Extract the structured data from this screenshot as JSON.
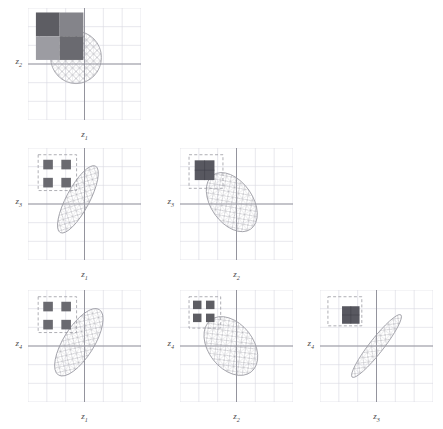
{
  "figure": {
    "type": "pairwise-covariance-ellipse-matrix",
    "width": 443,
    "height": 429,
    "background": "#ffffff",
    "variables": [
      "z1",
      "z2",
      "z3",
      "z4"
    ],
    "grid_color": "#d8d8e0",
    "axis_color": "#8a8a94",
    "ellipse_stroke": "#9a9aa2",
    "mesh_color": "#a8a8b0",
    "inset_dash_color": "#9a9aa2"
  },
  "chart_data": {
    "type": "scatter",
    "title": "",
    "xlabel": "",
    "ylabel": "",
    "grid": true,
    "legend": null,
    "panels": [
      {
        "id": "panel-z2-z1",
        "row": 0,
        "col": 0,
        "xlabel": "z",
        "xlabel_sub": "1",
        "ylabel": "z",
        "ylabel_sub": "2",
        "xlim": [
          -3,
          3
        ],
        "ylim": [
          -3,
          3
        ],
        "grid_divisions": 6,
        "ellipse": {
          "cx": -0.45,
          "cy": 0.35,
          "rx": 1.35,
          "ry": 1.4,
          "angle_deg": 0,
          "correlation": 0.0,
          "shape": "circle"
        },
        "inset": {
          "kind": "matrix-2x2-contiguous",
          "dash_box": {
            "x": 0.1,
            "y": 0.06,
            "w": 0.33,
            "h": 0.33
          },
          "blocks": [
            {
              "r": 0,
              "c": 0,
              "shade": "#5d5d63"
            },
            {
              "r": 0,
              "c": 1,
              "shade": "#84848a"
            },
            {
              "r": 1,
              "c": 0,
              "shade": "#9c9ca2"
            },
            {
              "r": 1,
              "c": 1,
              "shade": "#6a6a70"
            }
          ],
          "block_origin": {
            "x": 0.07,
            "y": 0.04
          },
          "block_size": 0.21
        }
      },
      {
        "id": "panel-z3-z1",
        "row": 1,
        "col": 0,
        "xlabel": "z",
        "xlabel_sub": "1",
        "ylabel": "z",
        "ylabel_sub": "3",
        "xlim": [
          -3,
          3
        ],
        "ylim": [
          -3,
          3
        ],
        "grid_divisions": 6,
        "ellipse": {
          "cx": -0.35,
          "cy": 0.25,
          "rx": 2.0,
          "ry": 0.62,
          "angle_deg": -62,
          "correlation": 0.88,
          "shape": "narrow-ellipse"
        },
        "inset": {
          "kind": "matrix-2x2-separated",
          "dash_box": {
            "x": 0.09,
            "y": 0.06,
            "w": 0.34,
            "h": 0.32
          },
          "blocks": [
            {
              "r": 0,
              "c": 0,
              "shade": "#6a6a70"
            },
            {
              "r": 0,
              "c": 1,
              "shade": "#6a6a70"
            },
            {
              "r": 1,
              "c": 0,
              "shade": "#6a6a70"
            },
            {
              "r": 1,
              "c": 1,
              "shade": "#6a6a70"
            }
          ],
          "block_size": 0.085,
          "block_gap": 0.075
        }
      },
      {
        "id": "panel-z3-z2",
        "row": 1,
        "col": 1,
        "xlabel": "z",
        "xlabel_sub": "2",
        "ylabel": "z",
        "ylabel_sub": "3",
        "xlim": [
          -3,
          3
        ],
        "ylim": [
          -3,
          3
        ],
        "grid_divisions": 6,
        "ellipse": {
          "cx": -0.25,
          "cy": 0.1,
          "rx": 1.75,
          "ry": 1.12,
          "angle_deg": 55,
          "correlation": -0.45,
          "shape": "wide-ellipse"
        },
        "inset": {
          "kind": "matrix-single-block",
          "dash_box": {
            "x": 0.08,
            "y": 0.06,
            "w": 0.3,
            "h": 0.3
          },
          "blocks": [
            {
              "r": 0,
              "c": 0,
              "shade": "#585860"
            }
          ],
          "block_origin": {
            "x": 0.13,
            "y": 0.11
          },
          "block_size": 0.175
        }
      },
      {
        "id": "panel-z4-z1",
        "row": 2,
        "col": 0,
        "xlabel": "z",
        "xlabel_sub": "1",
        "ylabel": "z",
        "ylabel_sub": "4",
        "xlim": [
          -3,
          3
        ],
        "ylim": [
          -3,
          3
        ],
        "grid_divisions": 6,
        "ellipse": {
          "cx": -0.3,
          "cy": 0.2,
          "rx": 2.05,
          "ry": 0.82,
          "angle_deg": -58,
          "correlation": 0.8,
          "shape": "narrow-ellipse"
        },
        "inset": {
          "kind": "matrix-2x2-separated",
          "dash_box": {
            "x": 0.09,
            "y": 0.06,
            "w": 0.34,
            "h": 0.32
          },
          "blocks": [
            {
              "r": 0,
              "c": 0,
              "shade": "#6a6a70"
            },
            {
              "r": 0,
              "c": 1,
              "shade": "#6a6a70"
            },
            {
              "r": 1,
              "c": 0,
              "shade": "#6a6a70"
            },
            {
              "r": 1,
              "c": 1,
              "shade": "#6a6a70"
            }
          ],
          "block_size": 0.085,
          "block_gap": 0.075
        }
      },
      {
        "id": "panel-z4-z2",
        "row": 2,
        "col": 1,
        "xlabel": "z",
        "xlabel_sub": "2",
        "ylabel": "z",
        "ylabel_sub": "4",
        "xlim": [
          -3,
          3
        ],
        "ylim": [
          -3,
          3
        ],
        "grid_divisions": 6,
        "ellipse": {
          "cx": -0.3,
          "cy": 0.0,
          "rx": 1.75,
          "ry": 1.2,
          "angle_deg": 52,
          "correlation": -0.4,
          "shape": "wide-ellipse"
        },
        "inset": {
          "kind": "matrix-2x2-tight",
          "dash_box": {
            "x": 0.08,
            "y": 0.06,
            "w": 0.28,
            "h": 0.28
          },
          "blocks": [
            {
              "r": 0,
              "c": 0,
              "shade": "#5d5d63"
            },
            {
              "r": 0,
              "c": 1,
              "shade": "#5d5d63"
            },
            {
              "r": 1,
              "c": 0,
              "shade": "#5d5d63"
            },
            {
              "r": 1,
              "c": 1,
              "shade": "#5d5d63"
            }
          ],
          "block_size": 0.075,
          "block_gap": 0.04,
          "block_origin": {
            "x": 0.115,
            "y": 0.095
          }
        }
      },
      {
        "id": "panel-z4-z3",
        "row": 2,
        "col": 2,
        "xlabel": "z",
        "xlabel_sub": "3",
        "ylabel": "z",
        "ylabel_sub": "4",
        "xlim": [
          -3,
          3
        ],
        "ylim": [
          -3,
          3
        ],
        "grid_divisions": 6,
        "ellipse": {
          "cx": 0.0,
          "cy": 0.0,
          "rx": 2.1,
          "ry": 0.38,
          "angle_deg": -52,
          "correlation": 0.96,
          "shape": "very-narrow-ellipse"
        },
        "inset": {
          "kind": "matrix-single-block-offset",
          "dash_box": {
            "x": 0.07,
            "y": 0.06,
            "w": 0.3,
            "h": 0.26
          },
          "blocks": [
            {
              "r": 1,
              "c": 1,
              "shade": "#585860"
            }
          ],
          "block_origin": {
            "x": 0.195,
            "y": 0.145
          },
          "block_size": 0.155
        }
      }
    ]
  }
}
